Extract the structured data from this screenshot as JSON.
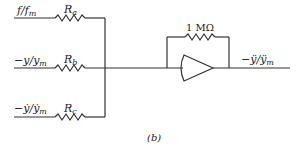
{
  "figure_label": "(b)",
  "inputs": [
    {
      "label_main": "f/f",
      "label_sub": "m",
      "resistor": "R",
      "resistor_sub": "a"
    },
    {
      "label_main": "−y/y",
      "label_sub": "m",
      "resistor": "R",
      "resistor_sub": "b"
    },
    {
      "label_main": "−ẏ/ẏ",
      "label_sub": "m",
      "resistor": "R",
      "resistor_sub": "c"
    }
  ],
  "feedback_resistor": "1 MΩ",
  "output": {
    "label_main": "−ÿ/ÿ",
    "label_sub": "m"
  },
  "colors": {
    "line": "#333333",
    "text": "#222222",
    "background": "#ffffff"
  }
}
